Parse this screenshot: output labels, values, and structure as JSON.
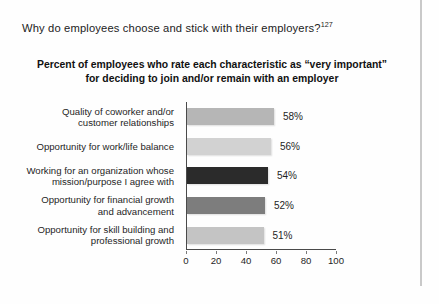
{
  "page": {
    "header_question": "Why do employees choose and stick with their employers?",
    "header_footnote": "127"
  },
  "chart_data": {
    "type": "bar",
    "orientation": "horizontal",
    "title": "Percent of employees who rate each characteristic as “very important” for deciding to join and/or remain with an employer",
    "title_line1": "Percent of employees who rate each characteristic as “very important”",
    "title_line2": "for deciding to join and/or remain with an employer",
    "categories": [
      "Quality of coworker and/or customer relationships",
      "Opportunity for work/life balance",
      "Working for an organization whose mission/purpose I agree with",
      "Opportunity for financial growth and advancement",
      "Opportunity for skill building and professional growth"
    ],
    "category_lines": [
      [
        "Quality of coworker and/or",
        "customer relationships"
      ],
      [
        "Opportunity for work/life balance"
      ],
      [
        "Working for an organization whose",
        "mission/purpose I agree with"
      ],
      [
        "Opportunity for financial growth",
        "and advancement"
      ],
      [
        "Opportunity for skill building and",
        "professional growth"
      ]
    ],
    "values": [
      58,
      56,
      54,
      52,
      51
    ],
    "value_labels": [
      "58%",
      "56%",
      "54%",
      "52%",
      "51%"
    ],
    "bar_colors": [
      "#b6b6b6",
      "#d2d2d2",
      "#2b2b2b",
      "#7d7d7d",
      "#c4c4c4"
    ],
    "xlabel": "",
    "ylabel": "",
    "xlim": [
      0,
      100
    ],
    "xticks": [
      0,
      20,
      40,
      60,
      80,
      100
    ],
    "xtick_labels": [
      "0",
      "20",
      "40",
      "60",
      "80",
      "100"
    ],
    "grid": false,
    "legend": false
  }
}
